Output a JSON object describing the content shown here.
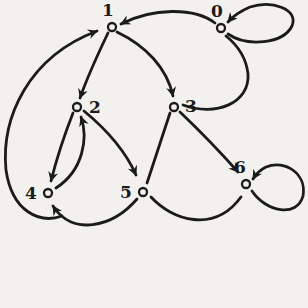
{
  "figure": {
    "type": "directed-graph",
    "background_color": "#f2f1ed",
    "ink_color": "#1b1b1b",
    "nodes": [
      {
        "id": "0",
        "label": "0",
        "x": 221,
        "y": 28,
        "label_x": 217,
        "label_y": 17
      },
      {
        "id": "1",
        "label": "1",
        "x": 112,
        "y": 27,
        "label_x": 108,
        "label_y": 16
      },
      {
        "id": "2",
        "label": "2",
        "x": 77,
        "y": 107,
        "label_x": 95,
        "label_y": 113
      },
      {
        "id": "3",
        "label": "3",
        "x": 174,
        "y": 107,
        "label_x": 191,
        "label_y": 112
      },
      {
        "id": "4",
        "label": "4",
        "x": 48,
        "y": 193,
        "label_x": 31,
        "label_y": 199
      },
      {
        "id": "5",
        "label": "5",
        "x": 143,
        "y": 192,
        "label_x": 126,
        "label_y": 198
      },
      {
        "id": "6",
        "label": "6",
        "x": 246,
        "y": 184,
        "label_x": 240,
        "label_y": 173
      }
    ],
    "edges": [
      {
        "from": "0",
        "to": "1",
        "self_loop": false,
        "arrowhead": true,
        "path": "M 215 23 C 194 7, 152 8, 121 24"
      },
      {
        "from": "0",
        "to": "0",
        "self_loop": true,
        "arrowhead": true,
        "path": "M 228 34 C 247 47, 283 44, 292 26 C 299 9, 272 0, 250 7 C 243 10, 234 15, 228 22"
      },
      {
        "from": "1",
        "to": "2",
        "self_loop": false,
        "arrowhead": true,
        "path": "M 108 33 C 97 56, 87 78, 80 98"
      },
      {
        "from": "1",
        "to": "3",
        "self_loop": false,
        "arrowhead": true,
        "path": "M 117 32 C 146 46, 167 68, 173 96"
      },
      {
        "from": "2",
        "to": "4",
        "self_loop": false,
        "arrowhead": true,
        "path": "M 73 113 C 64 136, 56 161, 51 181"
      },
      {
        "from": "4",
        "to": "2",
        "self_loop": false,
        "arrowhead": true,
        "path": "M 56 188 C 84 170, 88 137, 81 117"
      },
      {
        "from": "2",
        "to": "5",
        "self_loop": false,
        "arrowhead": true,
        "path": "M 84 111 C 107 130, 126 152, 136 175"
      },
      {
        "from": "3",
        "to": "5",
        "self_loop": false,
        "arrowhead": false,
        "path": "M 170 113 C 162 138, 154 161, 147 183"
      },
      {
        "from": "3",
        "to": "6",
        "self_loop": false,
        "arrowhead": true,
        "path": "M 180 112 C 202 133, 222 154, 238 172"
      },
      {
        "from": "3",
        "to": "0",
        "self_loop": false,
        "arrowhead": false,
        "path": "M 183 105 C 216 117, 250 103, 248 74 C 246 56, 236 44, 226 36"
      },
      {
        "from": "4",
        "to": "1",
        "self_loop": false,
        "arrowhead": true,
        "path": "M 62 216 C 40 224, 12 212, 6 170 C 1 118, 28 57, 97 31"
      },
      {
        "from": "5",
        "to": "4",
        "self_loop": false,
        "arrowhead": true,
        "path": "M 137 199 C 112 228, 72 236, 53 206"
      },
      {
        "from": "5",
        "to": "6",
        "self_loop": false,
        "arrowhead": false,
        "path": "M 151 197 C 172 220, 214 234, 241 197"
      },
      {
        "from": "6",
        "to": "6",
        "self_loop": true,
        "arrowhead": true,
        "path": "M 252 191 C 266 212, 297 218, 303 196 C 307 174, 285 159, 266 167 C 260 170, 256 174, 253 179"
      }
    ],
    "style": {
      "edge_stroke_width": 2.8,
      "node_radius": 4,
      "node_stroke_width": 2.3
    }
  }
}
